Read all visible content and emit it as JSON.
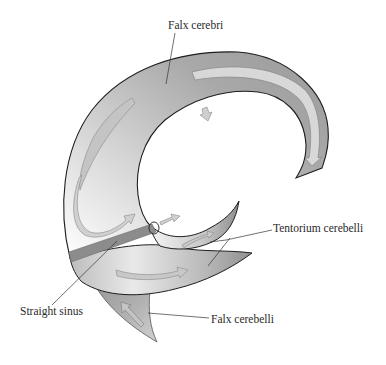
{
  "diagram": {
    "labels": {
      "falx_cerebri": "Falx cerebri",
      "tentorium_cerebelli": "Tentorium cerebelli",
      "straight_sinus": "Straight sinus",
      "falx_cerebelli": "Falx cerebelli"
    },
    "structures": [
      {
        "id": "falx-cerebri",
        "name": "Falx cerebri",
        "shape": "C-shaped sickle"
      },
      {
        "id": "tentorium-cerebelli",
        "name": "Tentorium cerebelli",
        "shape": "two lateral horn-like wings"
      },
      {
        "id": "straight-sinus",
        "name": "Straight sinus",
        "shape": "oblique band"
      },
      {
        "id": "falx-cerebelli",
        "name": "Falx cerebelli",
        "shape": "downward sickle"
      }
    ],
    "flow_arrows": 8,
    "colors": {
      "membrane_dark": "#8f8f8f",
      "membrane_light": "#f2f2f2",
      "outline": "#1e1e1e",
      "arrow_fill": "#c4c4c4",
      "arrow_stroke": "#8a8a8a",
      "sinus_band": "#8c8c8c",
      "text": "#2a2a2a",
      "background": "#ffffff"
    }
  }
}
